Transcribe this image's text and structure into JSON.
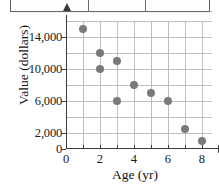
{
  "top_strip": {
    "present": true,
    "description": "partial-table-border"
  },
  "chart_data": {
    "type": "scatter",
    "title": "",
    "xlabel": "Age (yr)",
    "ylabel": "Value (dollars)",
    "xlim": [
      0,
      8.6
    ],
    "ylim": [
      0,
      16000
    ],
    "grid": true,
    "legend": null,
    "x_ticks": [
      0,
      2,
      4,
      6,
      8
    ],
    "x_tick_labels": [
      "0",
      "2",
      "4",
      "6",
      "8"
    ],
    "x_minor_ticks": [
      1,
      3,
      5,
      7
    ],
    "y_ticks": [
      0,
      2000,
      6000,
      10000,
      14000
    ],
    "y_tick_labels": [
      "0",
      "2,000",
      "6,000",
      "10,000",
      "14,000"
    ],
    "x_gridlines": [
      1,
      2,
      3,
      4,
      5,
      6,
      7,
      8
    ],
    "y_gridlines": [
      2000,
      4000,
      6000,
      8000,
      10000,
      12000,
      14000,
      16000
    ],
    "marker_color": "#7a7a7e",
    "grid_color": "#bdbdc6",
    "axis_color": "#3a3a3a",
    "points": [
      {
        "x": 1,
        "y": 15000
      },
      {
        "x": 2,
        "y": 12000
      },
      {
        "x": 2,
        "y": 10000
      },
      {
        "x": 3,
        "y": 11000
      },
      {
        "x": 3,
        "y": 6000
      },
      {
        "x": 4,
        "y": 8000
      },
      {
        "x": 5,
        "y": 7000
      },
      {
        "x": 6,
        "y": 6000
      },
      {
        "x": 7,
        "y": 2500
      },
      {
        "x": 8,
        "y": 1000
      }
    ]
  }
}
